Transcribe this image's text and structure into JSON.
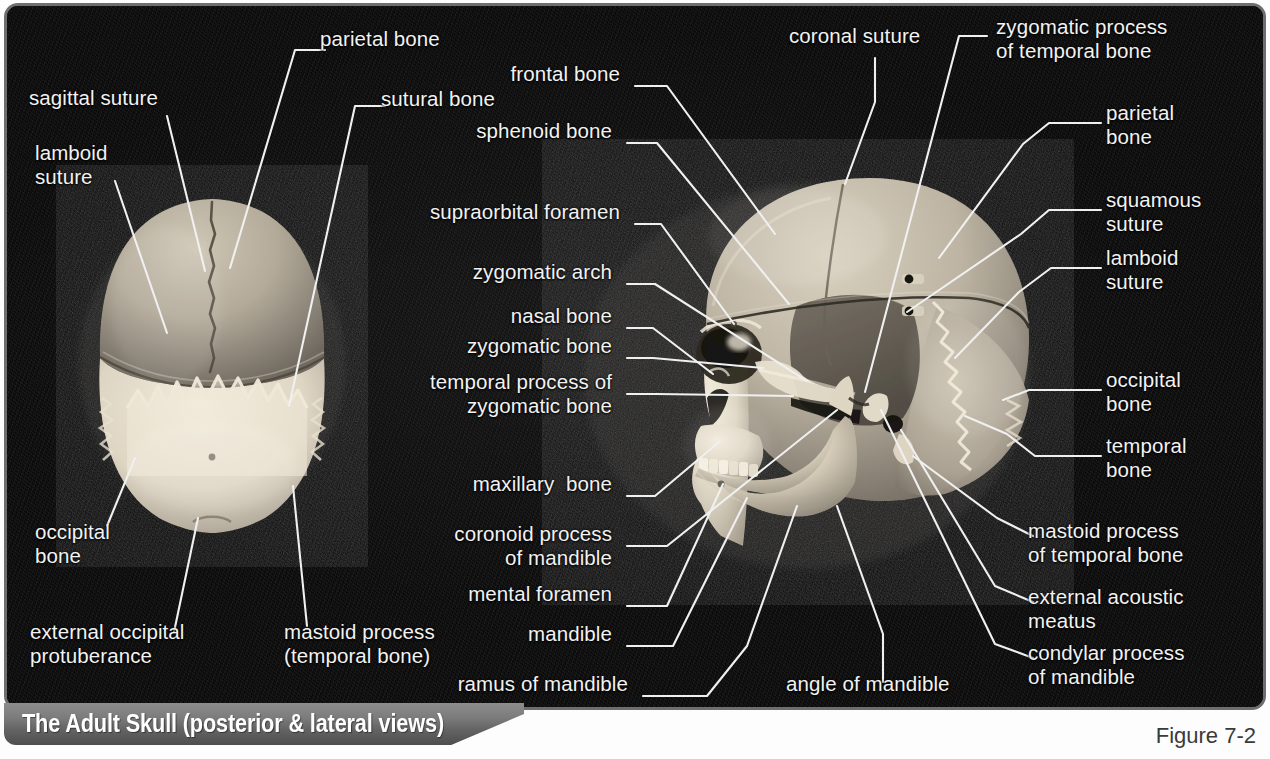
{
  "figure": {
    "caption": "The Adult Skull (posterior & lateral views)",
    "number": "Figure 7-2"
  },
  "colors": {
    "plate_background": "#0b0b0b",
    "plate_border": "#6e6e6e",
    "label_text": "#f2f2f2",
    "leader_line": "#f0f0f0",
    "banner_gradient_top": "#8d8d8d",
    "banner_gradient_bottom": "#4e4e4e",
    "banner_text": "#ffffff",
    "figure_number_text": "#3a3a3a",
    "bone_light": "#e9e3d6",
    "bone_mid": "#b9b0a1",
    "bone_shadow": "#6d665c"
  },
  "labels": {
    "posterior_view": [
      {
        "id": "parietal-bone",
        "text": "parietal bone"
      },
      {
        "id": "sagittal-suture",
        "text": "sagittal suture"
      },
      {
        "id": "sutural-bone",
        "text": "sutural bone"
      },
      {
        "id": "lamboid-suture",
        "text": "lamboid\nsuture"
      },
      {
        "id": "occipital-bone",
        "text": "occipital\nbone"
      },
      {
        "id": "external-occipital-protuberance",
        "text": "external occipital\nprotuberance"
      },
      {
        "id": "mastoid-process-temporal-bone",
        "text": "mastoid process\n(temporal bone)"
      }
    ],
    "lateral_view_left": [
      {
        "id": "frontal-bone",
        "text": "frontal bone"
      },
      {
        "id": "sphenoid-bone",
        "text": "sphenoid bone"
      },
      {
        "id": "supraorbital-foramen",
        "text": "supraorbital foramen"
      },
      {
        "id": "zygomatic-arch",
        "text": "zygomatic arch"
      },
      {
        "id": "nasal-bone",
        "text": "nasal bone"
      },
      {
        "id": "zygomatic-bone",
        "text": "zygomatic bone"
      },
      {
        "id": "temporal-process-of-zygomatic-bone",
        "text": "temporal process of\nzygomatic bone"
      },
      {
        "id": "maxillary-bone",
        "text": "maxillary  bone"
      },
      {
        "id": "coronoid-process-of-mandible",
        "text": "coronoid process\nof mandible"
      },
      {
        "id": "mental-foramen",
        "text": "mental foramen"
      },
      {
        "id": "mandible",
        "text": "mandible"
      },
      {
        "id": "ramus-of-mandible",
        "text": "ramus of mandible"
      },
      {
        "id": "angle-of-mandible",
        "text": "angle of mandible"
      }
    ],
    "lateral_view_right": [
      {
        "id": "coronal-suture",
        "text": "coronal suture"
      },
      {
        "id": "zygomatic-process-of-temporal-bone",
        "text": "zygomatic process\nof temporal bone"
      },
      {
        "id": "parietal-bone-lateral",
        "text": "parietal\nbone"
      },
      {
        "id": "squamous-suture",
        "text": "squamous\nsuture"
      },
      {
        "id": "lamboid-suture-lateral",
        "text": "lamboid\nsuture"
      },
      {
        "id": "occipital-bone-lateral",
        "text": "occipital\nbone"
      },
      {
        "id": "temporal-bone",
        "text": "temporal\nbone"
      },
      {
        "id": "mastoid-process-of-temporal-bone",
        "text": "mastoid process\nof temporal bone"
      },
      {
        "id": "external-acoustic-meatus",
        "text": "external acoustic\nmeatus"
      },
      {
        "id": "condylar-process-of-mandible",
        "text": "condylar process\nof mandible"
      }
    ]
  }
}
